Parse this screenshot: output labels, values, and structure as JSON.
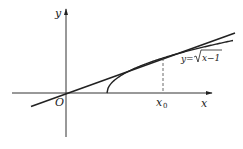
{
  "diagram": {
    "type": "function-graph-with-tangent",
    "axes": {
      "x_label": "x",
      "y_label": "y",
      "origin_label": "O"
    },
    "curve": {
      "equation_label_prefix": "y=",
      "equation_radicand": "x−1",
      "function": "sqrt(x-1)",
      "starts_at_x": 1
    },
    "tangent_line": {
      "passes_through_origin": true,
      "tangent_to": "curve"
    },
    "tangent_point": {
      "label_base": "x",
      "label_subscript": "0",
      "dashed_drop_to_axis": true
    }
  }
}
